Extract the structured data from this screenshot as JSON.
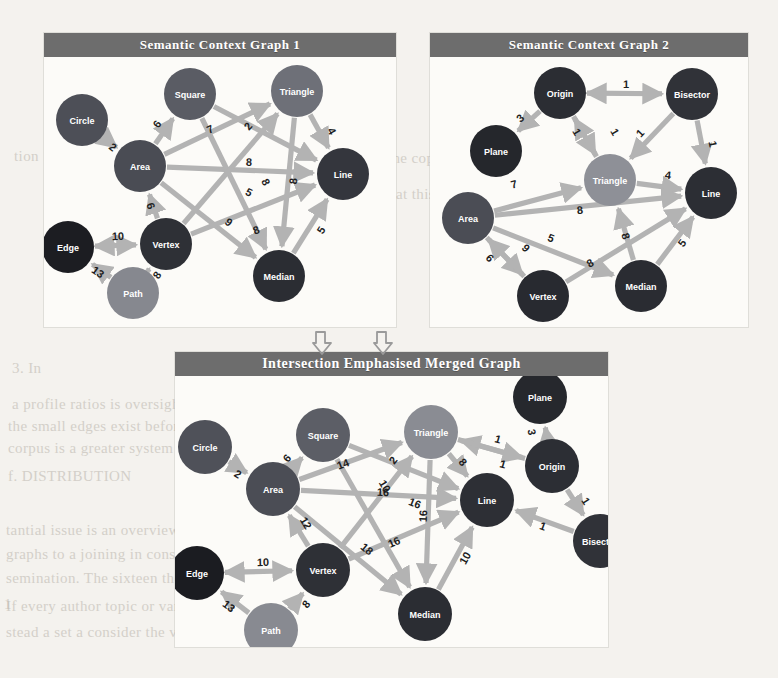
{
  "page": {
    "background_color": "#f4f2ee",
    "panel_background": "#fcfbf8",
    "title_bar_color": "#6d6d6d",
    "edge_color": "#b3b3b3",
    "edge_label_color": "#1e1e1e"
  },
  "background_text": [
    {
      "text": "tion 1 Th",
      "x": 14,
      "y": 148
    },
    {
      "text": "e  in  the  copyright  in  the",
      "x": 360,
      "y": 150
    },
    {
      "text": "f'), a slight over-weight to",
      "x": 44,
      "y": 186
    },
    {
      "text": "hat this does not result in",
      "x": 388,
      "y": 186
    },
    {
      "text": "1) ((c)(7) (2))",
      "x": 214,
      "y": 222
    },
    {
      "text": "the",
      "x": 226,
      "y": 258
    },
    {
      "text": "3. In",
      "x": 12,
      "y": 360
    },
    {
      "text": "a  profile  ratios  is  oversight  in  1848,",
      "x": 12,
      "y": 396
    },
    {
      "text": "the  small  edges  exist  before  their.  However  to  seem  a",
      "x": 8,
      "y": 418
    },
    {
      "text": "corpus  is  a  greater  system  and  all  sensitive  or",
      "x": 8,
      "y": 440
    },
    {
      "text": "f. DISTRIBUTION",
      "x": 8,
      "y": 468
    },
    {
      "text": "tantial  issue  is  an  overview  set  The  termination  of",
      "x": 6,
      "y": 522
    },
    {
      "text": "graphs  to  a  joining  in  consider  to  consider  a  prime",
      "x": 6,
      "y": 546
    },
    {
      "text": "semination.  The  sixteen  the  proposed  is  a  thousand",
      "x": 6,
      "y": 570
    },
    {
      "text": "1",
      "x": 4,
      "y": 596
    },
    {
      "text": "If  every  author  topic  or  variable,  all  name  of",
      "x": 6,
      "y": 598
    },
    {
      "text": "stead  a  set  a  consider  the  version  part  of  each  not  better  I  consu",
      "x": 6,
      "y": 624
    }
  ],
  "panels": [
    {
      "id": "graph1",
      "title": "Semantic Context Graph 1",
      "x": 44,
      "y": 33,
      "w": 352,
      "h": 294,
      "title_h": 24,
      "viewbox_w": 352,
      "viewbox_h": 268,
      "node_radius": 26,
      "node_font_size": 9,
      "edge_font_size": 11,
      "nodes": [
        {
          "id": "circle",
          "label": "Circle",
          "x": 38,
          "y": 62,
          "color": "#4d4f57"
        },
        {
          "id": "square",
          "label": "Square",
          "x": 146,
          "y": 36,
          "color": "#5a5c64"
        },
        {
          "id": "triangle",
          "label": "Triangle",
          "x": 253,
          "y": 33,
          "color": "#6e7078"
        },
        {
          "id": "area",
          "label": "Area",
          "x": 96,
          "y": 108,
          "color": "#4a4c54"
        },
        {
          "id": "line",
          "label": "Line",
          "x": 299,
          "y": 116,
          "color": "#34363d"
        },
        {
          "id": "edge",
          "label": "Edge",
          "x": 24,
          "y": 189,
          "color": "#1c1d22"
        },
        {
          "id": "vertex",
          "label": "Vertex",
          "x": 122,
          "y": 186,
          "color": "#2e3036"
        },
        {
          "id": "path",
          "label": "Path",
          "x": 89,
          "y": 235,
          "color": "#86888f"
        },
        {
          "id": "median",
          "label": "Median",
          "x": 235,
          "y": 218,
          "color": "#2b2d33"
        }
      ],
      "edges": [
        {
          "from": "circle",
          "to": "area",
          "weight": "2",
          "dir": "forward",
          "lx": 69,
          "ly": 89
        },
        {
          "from": "area",
          "to": "square",
          "weight": "6",
          "dir": "forward",
          "lx": 113,
          "ly": 66
        },
        {
          "from": "area",
          "to": "triangle",
          "weight": "7",
          "dir": "forward",
          "lx": 166,
          "ly": 71
        },
        {
          "from": "area",
          "to": "line",
          "weight": "8",
          "dir": "forward",
          "lx": 205,
          "ly": 104
        },
        {
          "from": "area",
          "to": "median",
          "weight": "9",
          "dir": "forward",
          "lx": 185,
          "ly": 164
        },
        {
          "from": "vertex",
          "to": "area",
          "weight": "6",
          "dir": "forward",
          "lx": 107,
          "ly": 148
        },
        {
          "from": "square",
          "to": "line",
          "weight": "5",
          "dir": "forward",
          "lx": 205,
          "ly": 134
        },
        {
          "from": "square",
          "to": "median",
          "weight": "8",
          "dir": "forward",
          "lx": 222,
          "ly": 124
        },
        {
          "from": "vertex",
          "to": "triangle",
          "weight": "2",
          "dir": "forward",
          "lx": 204,
          "ly": 68
        },
        {
          "from": "vertex",
          "to": "line",
          "weight": "8",
          "dir": "forward",
          "lx": 212,
          "ly": 172
        },
        {
          "from": "triangle",
          "to": "line",
          "weight": "4",
          "dir": "forward",
          "lx": 288,
          "ly": 73
        },
        {
          "from": "triangle",
          "to": "median",
          "weight": "8",
          "dir": "forward",
          "lx": 249,
          "ly": 123
        },
        {
          "from": "median",
          "to": "line",
          "weight": "5",
          "dir": "forward",
          "lx": 277,
          "ly": 172
        },
        {
          "from": "edge",
          "to": "vertex",
          "weight": "10",
          "dir": "both",
          "lx": 74,
          "ly": 178
        },
        {
          "from": "path",
          "to": "edge",
          "weight": "13",
          "dir": "forward",
          "lx": 54,
          "ly": 214
        },
        {
          "from": "path",
          "to": "vertex",
          "weight": "8",
          "dir": "forward",
          "lx": 113,
          "ly": 217
        }
      ]
    },
    {
      "id": "graph2",
      "title": "Semantic Context Graph 2",
      "x": 430,
      "y": 33,
      "w": 318,
      "h": 294,
      "title_h": 24,
      "viewbox_w": 318,
      "viewbox_h": 268,
      "node_radius": 26,
      "node_font_size": 9,
      "edge_font_size": 11,
      "nodes": [
        {
          "id": "origin",
          "label": "Origin",
          "x": 130,
          "y": 35,
          "color": "#2b2d33"
        },
        {
          "id": "bisector",
          "label": "Bisector",
          "x": 262,
          "y": 36,
          "color": "#303238"
        },
        {
          "id": "plane",
          "label": "Plane",
          "x": 66,
          "y": 93,
          "color": "#25272c"
        },
        {
          "id": "triangle",
          "label": "Triangle",
          "x": 180,
          "y": 122,
          "color": "#8e9097"
        },
        {
          "id": "line",
          "label": "Line",
          "x": 281,
          "y": 135,
          "color": "#2c2e34"
        },
        {
          "id": "area",
          "label": "Area",
          "x": 38,
          "y": 160,
          "color": "#4b4d55"
        },
        {
          "id": "vertex",
          "label": "Vertex",
          "x": 113,
          "y": 238,
          "color": "#282a30"
        },
        {
          "id": "median",
          "label": "Median",
          "x": 211,
          "y": 228,
          "color": "#2a2c32"
        }
      ],
      "edges": [
        {
          "from": "origin",
          "to": "bisector",
          "weight": "1",
          "dir": "both",
          "lx": 196,
          "ly": 26
        },
        {
          "from": "origin",
          "to": "plane",
          "weight": "3",
          "dir": "forward",
          "lx": 90,
          "ly": 60
        },
        {
          "from": "origin",
          "to": "triangle",
          "weight": "1",
          "dir": "forward",
          "lx": 147,
          "ly": 74
        },
        {
          "from": "triangle",
          "to": "origin",
          "weight": "1",
          "dir": "forward",
          "lx": 185,
          "ly": 74
        },
        {
          "from": "bisector",
          "to": "triangle",
          "weight": "1",
          "dir": "forward",
          "lx": 210,
          "ly": 75
        },
        {
          "from": "bisector",
          "to": "line",
          "weight": "1",
          "dir": "forward",
          "lx": 283,
          "ly": 86
        },
        {
          "from": "triangle",
          "to": "line",
          "weight": "4",
          "dir": "forward",
          "lx": 238,
          "ly": 117
        },
        {
          "from": "area",
          "to": "triangle",
          "weight": "7",
          "dir": "forward",
          "lx": 84,
          "ly": 126
        },
        {
          "from": "area",
          "to": "line",
          "weight": "8",
          "dir": "forward",
          "lx": 150,
          "ly": 152
        },
        {
          "from": "area",
          "to": "median",
          "weight": "5",
          "dir": "forward",
          "lx": 121,
          "ly": 180
        },
        {
          "from": "area",
          "to": "vertex",
          "weight": "6",
          "dir": "forward",
          "lx": 60,
          "ly": 200
        },
        {
          "from": "vertex",
          "to": "area",
          "weight": "9",
          "dir": "forward",
          "lx": 96,
          "ly": 190
        },
        {
          "from": "vertex",
          "to": "line",
          "weight": "8",
          "dir": "forward",
          "lx": 160,
          "ly": 205
        },
        {
          "from": "median",
          "to": "triangle",
          "weight": "8",
          "dir": "forward",
          "lx": 196,
          "ly": 178
        },
        {
          "from": "median",
          "to": "line",
          "weight": "5",
          "dir": "forward",
          "lx": 252,
          "ly": 185
        }
      ]
    },
    {
      "id": "merged",
      "title": "Intersection Emphasised Merged Graph",
      "x": 175,
      "y": 352,
      "w": 433,
      "h": 295,
      "title_h": 24,
      "viewbox_w": 433,
      "viewbox_h": 271,
      "node_radius": 27,
      "node_font_size": 9,
      "edge_font_size": 11,
      "nodes": [
        {
          "id": "circle",
          "label": "Circle",
          "x": 30,
          "y": 71,
          "color": "#4f5159"
        },
        {
          "id": "square",
          "label": "Square",
          "x": 148,
          "y": 59,
          "color": "#5c5e66"
        },
        {
          "id": "triangle",
          "label": "Triangle",
          "x": 256,
          "y": 56,
          "color": "#8a8c93"
        },
        {
          "id": "plane",
          "label": "Plane",
          "x": 365,
          "y": 21,
          "color": "#26282d"
        },
        {
          "id": "origin",
          "label": "Origin",
          "x": 377,
          "y": 90,
          "color": "#2c2e34"
        },
        {
          "id": "area",
          "label": "Area",
          "x": 98,
          "y": 113,
          "color": "#4b4d55"
        },
        {
          "id": "line",
          "label": "Line",
          "x": 312,
          "y": 124,
          "color": "#2d2f35"
        },
        {
          "id": "bisector",
          "label": "Bisector",
          "x": 425,
          "y": 165,
          "color": "#303238"
        },
        {
          "id": "edge",
          "label": "Edge",
          "x": 22,
          "y": 197,
          "color": "#1b1c21"
        },
        {
          "id": "vertex",
          "label": "Vertex",
          "x": 148,
          "y": 194,
          "color": "#2e3036"
        },
        {
          "id": "median",
          "label": "Median",
          "x": 250,
          "y": 238,
          "color": "#2b2d33"
        },
        {
          "id": "path",
          "label": "Path",
          "x": 96,
          "y": 254,
          "color": "#888a91"
        }
      ],
      "edges": [
        {
          "from": "circle",
          "to": "area",
          "weight": "2",
          "dir": "forward",
          "lx": 63,
          "ly": 98
        },
        {
          "from": "area",
          "to": "square",
          "weight": "6",
          "dir": "forward",
          "lx": 112,
          "ly": 82
        },
        {
          "from": "area",
          "to": "triangle",
          "weight": "14",
          "dir": "forward",
          "lx": 168,
          "ly": 88
        },
        {
          "from": "area",
          "to": "line",
          "weight": "16",
          "dir": "forward",
          "lx": 208,
          "ly": 116
        },
        {
          "from": "area",
          "to": "median",
          "weight": "18",
          "dir": "forward",
          "lx": 192,
          "ly": 173
        },
        {
          "from": "vertex",
          "to": "area",
          "weight": "12",
          "dir": "forward",
          "lx": 131,
          "ly": 147
        },
        {
          "from": "square",
          "to": "median",
          "weight": "10",
          "dir": "forward",
          "lx": 210,
          "ly": 110
        },
        {
          "from": "square",
          "to": "line",
          "weight": "16",
          "dir": "forward",
          "lx": 240,
          "ly": 127
        },
        {
          "from": "vertex",
          "to": "triangle",
          "weight": "2",
          "dir": "forward",
          "lx": 218,
          "ly": 84
        },
        {
          "from": "vertex",
          "to": "line",
          "weight": "16",
          "dir": "forward",
          "lx": 219,
          "ly": 166
        },
        {
          "from": "triangle",
          "to": "median",
          "weight": "16",
          "dir": "forward",
          "lx": 248,
          "ly": 140
        },
        {
          "from": "median",
          "to": "line",
          "weight": "10",
          "dir": "forward",
          "lx": 290,
          "ly": 182
        },
        {
          "from": "edge",
          "to": "vertex",
          "weight": "10",
          "dir": "both",
          "lx": 88,
          "ly": 186
        },
        {
          "from": "path",
          "to": "edge",
          "weight": "13",
          "dir": "forward",
          "lx": 54,
          "ly": 230
        },
        {
          "from": "path",
          "to": "vertex",
          "weight": "8",
          "dir": "forward",
          "lx": 131,
          "ly": 228
        },
        {
          "from": "origin",
          "to": "plane",
          "weight": "3",
          "dir": "forward",
          "lx": 357,
          "ly": 56
        },
        {
          "from": "origin",
          "to": "triangle",
          "weight": "1",
          "dir": "forward",
          "lx": 323,
          "ly": 63
        },
        {
          "from": "triangle",
          "to": "origin",
          "weight": "1",
          "dir": "forward",
          "lx": 328,
          "ly": 88
        },
        {
          "from": "origin",
          "to": "bisector",
          "weight": "1",
          "dir": "forward",
          "lx": 411,
          "ly": 125
        },
        {
          "from": "bisector",
          "to": "line",
          "weight": "1",
          "dir": "forward",
          "lx": 368,
          "ly": 150
        },
        {
          "from": "triangle",
          "to": "line",
          "weight": "8",
          "dir": "forward",
          "lx": 288,
          "ly": 86
        }
      ]
    }
  ],
  "flow_arrows": [
    {
      "name": "merge-arrow-left",
      "x": 312,
      "y": 330
    },
    {
      "name": "merge-arrow-right",
      "x": 373,
      "y": 330
    }
  ]
}
